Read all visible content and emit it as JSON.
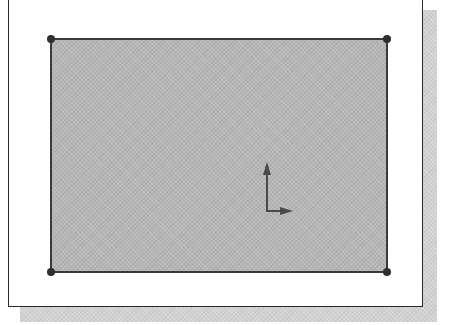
{
  "viewport": {
    "kind": "sketch-viewport",
    "background_color": "#ffffff",
    "frame_color": "#2a2a2a",
    "shadow_color": "#d2d2d2"
  },
  "sketch": {
    "entity": "rectangle",
    "fill_color": "#b6b6b6",
    "line_color": "#3a3a3a",
    "vertices": [
      {
        "name": "top-left",
        "x": 50,
        "y": 38
      },
      {
        "name": "top-right",
        "x": 387,
        "y": 38
      },
      {
        "name": "bottom-right",
        "x": 387,
        "y": 272
      },
      {
        "name": "bottom-left",
        "x": 50,
        "y": 272
      }
    ]
  },
  "origin": {
    "icon": "coordinate-axes-icon",
    "color": "#444444",
    "axes": [
      "x-axis-arrow",
      "y-axis-arrow"
    ]
  }
}
